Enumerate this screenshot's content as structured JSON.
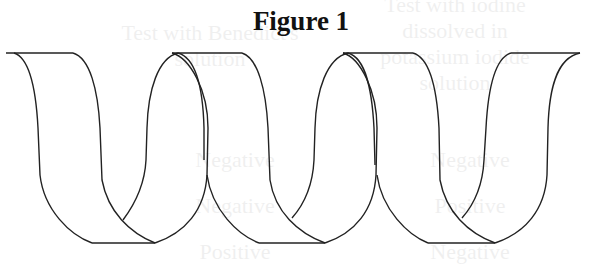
{
  "figure": {
    "title": "Figure 1",
    "turns": 3
  },
  "background_ghost_text": {
    "col1_header": [
      "Test with iodine",
      "dissolved in",
      "potassium iodide",
      "solution"
    ],
    "col2_header": [
      "Test with Benedict's",
      "solution"
    ],
    "col1_rows": [
      "Negative",
      "Positive",
      "Negative"
    ],
    "col2_rows": [
      "Negative",
      "Negative",
      "Positive"
    ]
  }
}
